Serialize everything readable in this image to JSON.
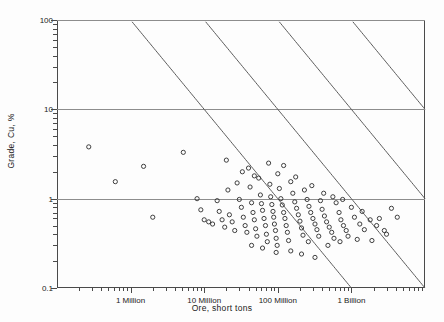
{
  "chart_data": {
    "type": "scatter",
    "title": "",
    "xlabel": "Ore, short tons",
    "ylabel": "Grade, Cu, %",
    "xscale": "log",
    "yscale": "log",
    "xlim": [
      100000,
      10000000000
    ],
    "ylim": [
      0.1,
      100
    ],
    "grid": true,
    "legend": "none",
    "xtick_labels": [
      "1 Million",
      "10 Million",
      "100 Million",
      "1 Billion"
    ],
    "xtick_values": [
      1000000,
      10000000,
      100000000,
      1000000000
    ],
    "ytick_labels": [
      "0.1",
      "1",
      "10",
      "100"
    ],
    "ytick_values": [
      0.1,
      1,
      10,
      100
    ],
    "annotations": [],
    "reference_lines": {
      "description": "parallel iso-contained-metal diagonals, slope -1 on log-log",
      "count": 4,
      "products_tons_times_percent": [
        100000000,
        1000000000,
        10000000000,
        100000000000
      ]
    },
    "points": [
      [
        270000,
        3.8
      ],
      [
        620000,
        1.55
      ],
      [
        1500000,
        2.3
      ],
      [
        2000000,
        0.62
      ],
      [
        5200000,
        3.3
      ],
      [
        8000000,
        1.0
      ],
      [
        9000000,
        0.75
      ],
      [
        10000000,
        0.58
      ],
      [
        11500000,
        0.55
      ],
      [
        13000000,
        0.52
      ],
      [
        15000000,
        0.95
      ],
      [
        16000000,
        0.72
      ],
      [
        17500000,
        0.58
      ],
      [
        19000000,
        0.48
      ],
      [
        20000000,
        2.7
      ],
      [
        21000000,
        1.25
      ],
      [
        22000000,
        0.66
      ],
      [
        24000000,
        0.55
      ],
      [
        26000000,
        0.44
      ],
      [
        28000000,
        1.5
      ],
      [
        30000000,
        0.98
      ],
      [
        32000000,
        0.8
      ],
      [
        34000000,
        0.62
      ],
      [
        36000000,
        0.5
      ],
      [
        38000000,
        0.42
      ],
      [
        40000000,
        2.2
      ],
      [
        42000000,
        1.35
      ],
      [
        44000000,
        0.9
      ],
      [
        46000000,
        0.7
      ],
      [
        48000000,
        0.58
      ],
      [
        50000000,
        0.46
      ],
      [
        52000000,
        0.38
      ],
      [
        55000000,
        1.7
      ],
      [
        58000000,
        1.1
      ],
      [
        60000000,
        0.88
      ],
      [
        62000000,
        0.74
      ],
      [
        65000000,
        0.6
      ],
      [
        68000000,
        0.5
      ],
      [
        70000000,
        0.4
      ],
      [
        72000000,
        0.33
      ],
      [
        75000000,
        2.5
      ],
      [
        78000000,
        1.45
      ],
      [
        80000000,
        1.05
      ],
      [
        83000000,
        0.86
      ],
      [
        86000000,
        0.72
      ],
      [
        88000000,
        0.62
      ],
      [
        90000000,
        0.52
      ],
      [
        93000000,
        0.44
      ],
      [
        95000000,
        0.36
      ],
      [
        98000000,
        0.3
      ],
      [
        100000000,
        1.9
      ],
      [
        105000000,
        1.3
      ],
      [
        110000000,
        1.0
      ],
      [
        115000000,
        0.85
      ],
      [
        120000000,
        0.7
      ],
      [
        125000000,
        0.6
      ],
      [
        130000000,
        0.5
      ],
      [
        135000000,
        0.42
      ],
      [
        140000000,
        0.34
      ],
      [
        150000000,
        1.55
      ],
      [
        160000000,
        1.15
      ],
      [
        170000000,
        0.92
      ],
      [
        180000000,
        0.78
      ],
      [
        190000000,
        0.66
      ],
      [
        200000000,
        0.56
      ],
      [
        210000000,
        0.47
      ],
      [
        220000000,
        0.39
      ],
      [
        230000000,
        1.25
      ],
      [
        250000000,
        0.98
      ],
      [
        265000000,
        0.82
      ],
      [
        280000000,
        0.7
      ],
      [
        300000000,
        0.6
      ],
      [
        320000000,
        0.52
      ],
      [
        340000000,
        0.45
      ],
      [
        360000000,
        0.38
      ],
      [
        380000000,
        0.95
      ],
      [
        400000000,
        0.76
      ],
      [
        430000000,
        0.64
      ],
      [
        460000000,
        0.55
      ],
      [
        500000000,
        0.48
      ],
      [
        540000000,
        0.42
      ],
      [
        580000000,
        0.36
      ],
      [
        620000000,
        0.9
      ],
      [
        680000000,
        0.7
      ],
      [
        720000000,
        0.58
      ],
      [
        780000000,
        0.5
      ],
      [
        850000000,
        0.44
      ],
      [
        900000000,
        0.38
      ],
      [
        1000000000,
        0.8
      ],
      [
        1100000000,
        0.62
      ],
      [
        1300000000,
        0.52
      ],
      [
        1500000000,
        0.45
      ],
      [
        1800000000,
        0.58
      ],
      [
        2200000000,
        0.5
      ],
      [
        2800000000,
        0.44
      ],
      [
        3500000000,
        0.78
      ],
      [
        4200000000,
        0.62
      ],
      [
        150000000,
        0.26
      ],
      [
        210000000,
        0.24
      ],
      [
        320000000,
        0.22
      ],
      [
        95000000,
        0.25
      ],
      [
        62000000,
        0.28
      ],
      [
        44000000,
        0.3
      ],
      [
        260000000,
        0.33
      ],
      [
        480000000,
        0.3
      ],
      [
        700000000,
        0.33
      ],
      [
        1200000000,
        0.35
      ],
      [
        1900000000,
        0.34
      ],
      [
        3000000000,
        0.4
      ],
      [
        48000000,
        1.8
      ],
      [
        33000000,
        2.0
      ],
      [
        120000000,
        2.35
      ],
      [
        175000000,
        1.75
      ],
      [
        290000000,
        1.4
      ],
      [
        420000000,
        1.15
      ],
      [
        560000000,
        1.05
      ],
      [
        760000000,
        0.98
      ],
      [
        1400000000,
        0.72
      ],
      [
        2400000000,
        0.6
      ]
    ]
  }
}
